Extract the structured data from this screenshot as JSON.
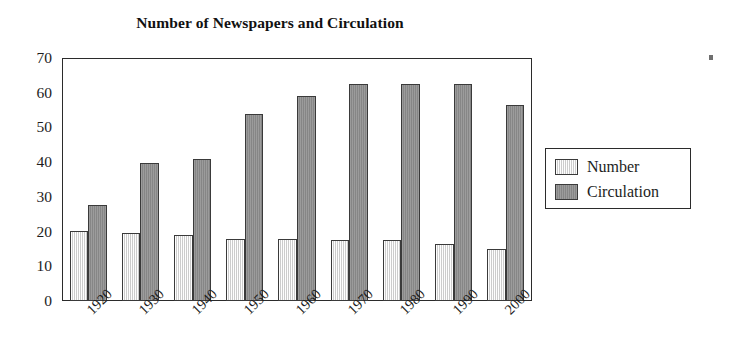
{
  "chart_data": {
    "type": "bar",
    "title": "Number of Newspapers and Circulation",
    "xlabel": "",
    "ylabel": "",
    "categories": [
      "1920",
      "1930",
      "1940",
      "1950",
      "1960",
      "1970",
      "1980",
      "1990",
      "2000"
    ],
    "series": [
      {
        "name": "Number",
        "color": "#e2e2e2",
        "values": [
          20.3,
          19.6,
          18.9,
          17.9,
          17.8,
          17.7,
          17.7,
          16.3,
          15.0
        ]
      },
      {
        "name": "Circulation",
        "color": "#8e8e8e",
        "values": [
          27.8,
          39.7,
          41.0,
          54.0,
          59.0,
          62.5,
          62.5,
          62.5,
          56.5
        ]
      }
    ],
    "ylim": [
      0,
      70
    ],
    "yticks": [
      0,
      10,
      20,
      30,
      40,
      50,
      60,
      70
    ],
    "ytick_labels": [
      "0",
      "10",
      "20",
      "30",
      "40",
      "50",
      "60",
      "70"
    ],
    "grid": false,
    "legend_position": "right",
    "xtick_rotation": -45,
    "frame_color": "#2b2b2b"
  },
  "legend": {
    "entries": [
      {
        "label": "Number",
        "swatch": "legend-swatch-number"
      },
      {
        "label": "Circulation",
        "swatch": "legend-swatch-circulation"
      }
    ]
  }
}
